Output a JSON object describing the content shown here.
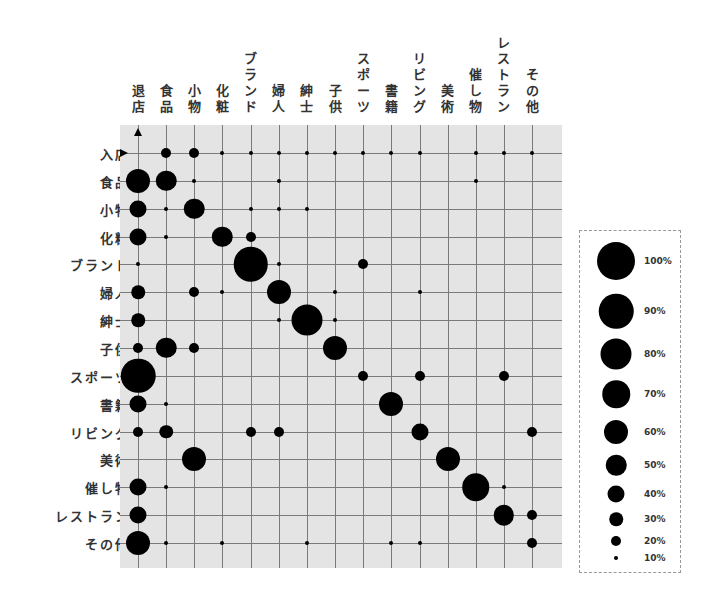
{
  "chart_data": {
    "type": "bubble-matrix",
    "title": "",
    "xlabel": "",
    "ylabel": "",
    "columns": [
      "退店",
      "食品",
      "小物",
      "化粧",
      "ブランド",
      "婦人",
      "紳士",
      "子供",
      "スポーツ",
      "書籍",
      "リビング",
      "美術",
      "催し物",
      "レストラン",
      "その他"
    ],
    "rows": [
      "入店",
      "食品",
      "小物",
      "化粧",
      "ブランド",
      "婦人",
      "紳士",
      "子供",
      "スポーツ",
      "書籍",
      "リビング",
      "美術",
      "催し物",
      "レストラン",
      "その他"
    ],
    "markers": {
      "column_arrow": "up",
      "row_arrow": "right"
    },
    "grid": true,
    "legend_position": "right",
    "legend": [
      {
        "label": "100%",
        "value": 100
      },
      {
        "label": "90%",
        "value": 90
      },
      {
        "label": "80%",
        "value": 80
      },
      {
        "label": "70%",
        "value": 70
      },
      {
        "label": "60%",
        "value": 60
      },
      {
        "label": "50%",
        "value": 50
      },
      {
        "label": "40%",
        "value": 40
      },
      {
        "label": "30%",
        "value": 30
      },
      {
        "label": "20%",
        "value": 20
      },
      {
        "label": "10%",
        "value": 10
      }
    ],
    "values": [
      [
        0,
        20,
        20,
        10,
        10,
        10,
        10,
        10,
        10,
        10,
        10,
        0,
        10,
        10,
        10
      ],
      [
        60,
        50,
        10,
        0,
        0,
        10,
        0,
        0,
        0,
        0,
        0,
        0,
        10,
        0,
        0
      ],
      [
        40,
        10,
        50,
        0,
        10,
        10,
        10,
        0,
        0,
        0,
        0,
        0,
        0,
        0,
        0
      ],
      [
        40,
        10,
        0,
        50,
        20,
        0,
        0,
        0,
        0,
        0,
        0,
        0,
        0,
        0,
        0
      ],
      [
        10,
        0,
        0,
        0,
        90,
        10,
        0,
        0,
        20,
        0,
        0,
        0,
        0,
        0,
        0
      ],
      [
        30,
        0,
        20,
        10,
        0,
        60,
        0,
        10,
        0,
        0,
        10,
        0,
        0,
        0,
        0
      ],
      [
        30,
        0,
        0,
        0,
        0,
        10,
        80,
        10,
        0,
        0,
        0,
        0,
        0,
        0,
        0
      ],
      [
        20,
        50,
        20,
        0,
        0,
        0,
        0,
        60,
        0,
        0,
        0,
        0,
        0,
        0,
        0
      ],
      [
        90,
        0,
        0,
        0,
        0,
        0,
        0,
        0,
        20,
        0,
        20,
        0,
        0,
        20,
        0
      ],
      [
        40,
        10,
        0,
        0,
        0,
        0,
        0,
        0,
        0,
        60,
        0,
        0,
        0,
        0,
        0
      ],
      [
        20,
        30,
        0,
        0,
        20,
        20,
        0,
        0,
        0,
        0,
        40,
        0,
        0,
        0,
        20
      ],
      [
        0,
        0,
        60,
        0,
        0,
        0,
        0,
        0,
        0,
        0,
        0,
        60,
        0,
        0,
        0
      ],
      [
        40,
        10,
        0,
        0,
        0,
        0,
        0,
        0,
        0,
        0,
        0,
        0,
        70,
        10,
        0
      ],
      [
        40,
        0,
        0,
        0,
        0,
        0,
        0,
        0,
        0,
        0,
        0,
        0,
        0,
        50,
        20
      ],
      [
        60,
        10,
        0,
        10,
        0,
        0,
        10,
        0,
        0,
        10,
        10,
        0,
        0,
        0,
        20
      ]
    ]
  },
  "colors": {
    "grid_background": "#e4e4e4",
    "grid_line": "#7a7a7a",
    "dot": "#000000",
    "legend_border": "#999999"
  }
}
